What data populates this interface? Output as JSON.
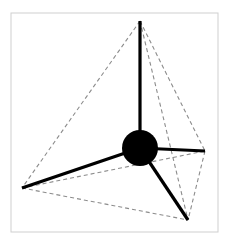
{
  "figure": {
    "canvas": {
      "width": 226,
      "height": 244,
      "background": "#ffffff"
    },
    "frame": {
      "name": "image-border",
      "x": 11,
      "y": 13,
      "width": 207,
      "height": 219,
      "stroke": "#cfcfcf",
      "stroke_width": 1,
      "fill": "#ffffff"
    },
    "center_atom": {
      "label": "central-atom",
      "cx": 140,
      "cy": 148,
      "r": 18,
      "fill": "#000000"
    },
    "vertices": [
      {
        "id": "top",
        "label": "apex-vertex",
        "x": 140,
        "y": 21
      },
      {
        "id": "left",
        "label": "left-vertex",
        "x": 22,
        "y": 188
      },
      {
        "id": "right",
        "label": "right-vertex",
        "x": 205,
        "y": 151
      },
      {
        "id": "bottom",
        "label": "bottom-front-vertex",
        "x": 188,
        "y": 220
      }
    ],
    "bonds": {
      "style": {
        "stroke": "#000000",
        "stroke_width": 3.2,
        "linecap": "butt"
      },
      "items": [
        {
          "id": "bond-up",
          "label": "bond-to-apex",
          "x1": 140,
          "y1": 148,
          "x2": 140,
          "y2": 21
        },
        {
          "id": "bond-left",
          "label": "bond-to-left",
          "x1": 140,
          "y1": 148,
          "x2": 22,
          "y2": 188
        },
        {
          "id": "bond-right",
          "label": "bond-to-right",
          "x1": 140,
          "y1": 148,
          "x2": 205,
          "y2": 151
        },
        {
          "id": "bond-bottom",
          "label": "bond-to-bottom-front",
          "x1": 140,
          "y1": 148,
          "x2": 188,
          "y2": 220
        }
      ]
    },
    "edges": {
      "style": {
        "stroke": "#8c8c8c",
        "stroke_width": 1.1,
        "dash": "4 3"
      },
      "items": [
        {
          "id": "edge-top-left",
          "label": "edge-apex-to-left",
          "x1": 140,
          "y1": 21,
          "x2": 22,
          "y2": 188
        },
        {
          "id": "edge-top-right",
          "label": "edge-apex-to-right",
          "x1": 140,
          "y1": 21,
          "x2": 205,
          "y2": 151
        },
        {
          "id": "edge-top-bottom",
          "label": "edge-apex-to-bottom-front",
          "x1": 140,
          "y1": 21,
          "x2": 188,
          "y2": 220
        },
        {
          "id": "edge-left-right",
          "label": "edge-left-to-right",
          "x1": 22,
          "y1": 188,
          "x2": 205,
          "y2": 151
        },
        {
          "id": "edge-left-bottom",
          "label": "edge-left-to-bottom-front",
          "x1": 22,
          "y1": 188,
          "x2": 188,
          "y2": 220
        },
        {
          "id": "edge-right-bottom",
          "label": "edge-right-to-bottom-front",
          "x1": 205,
          "y1": 151,
          "x2": 188,
          "y2": 220
        }
      ]
    }
  }
}
